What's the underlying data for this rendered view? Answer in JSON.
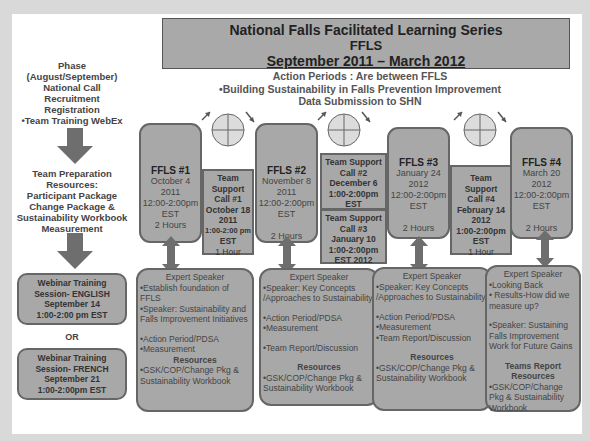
{
  "header": {
    "line1": "National  Falls Facilitated Learning Series",
    "line2": "FFLS",
    "line3": "September 2011 – March 2012"
  },
  "subtitle": {
    "line1": "Action Periods : Are between FFLS",
    "line2": "•Building Sustainability in Falls Prevention Improvement",
    "line3": "Data Submission to SHN"
  },
  "left_panel": {
    "phase": [
      "Phase  (August/September)",
      "National Call",
      "Recruitment",
      "Registration",
      "•Team Training  WebEx"
    ],
    "preparation": [
      "Team Preparation",
      "Resources:",
      "Participant Package",
      "Change Package &",
      "Sustainability Workbook",
      "Measurement"
    ],
    "webinar_english": [
      "Webinar Training",
      "Session- ENGLISH",
      "September 14",
      "1:00-2:00 pm EST"
    ],
    "or_label": "OR",
    "webinar_french": [
      "Webinar Training",
      "Session- FRENCH",
      "September 21",
      "1:00-2:00pm EST"
    ]
  },
  "pdsa_cycle": {
    "icon": "pdsa-cycle-icon",
    "quadrants": [
      "Act",
      "Plan",
      "Study",
      "Do"
    ]
  },
  "sessions": [
    {
      "title": "FFLS #1",
      "date": "October 4",
      "year": "2011",
      "time": "12:00-2:00pm",
      "tz": "EST",
      "duration": "2 Hours"
    },
    {
      "title": "FFLS #2",
      "date": "November 8",
      "year": "2011",
      "time": "12:00-2:00pm",
      "tz": "EST",
      "duration": "2 Hours"
    },
    {
      "title": "FFLS #3",
      "date": "January 24",
      "year": "2012",
      "time": "12:00-2:00pm",
      "tz": "EST",
      "duration": "2 Hours"
    },
    {
      "title": "FFLS #4",
      "date": "March 20",
      "year": "2012",
      "time": "12:00-2:00pm",
      "tz": "EST",
      "duration": "2 Hours"
    }
  ],
  "support_calls": [
    {
      "lines": [
        "Team",
        "Support",
        "Call #1",
        "October 18",
        "2011",
        "1:00-2:00 pm",
        "EST"
      ],
      "duration": "1 Hour"
    },
    {
      "lines": [
        "Team Support",
        "Call #2",
        "December 6",
        "1:00-2:00pm",
        "EST"
      ],
      "duration": ""
    },
    {
      "lines": [
        "Team Support",
        "Call #3",
        "January 10",
        "1:00-2:00pm",
        "EST 2012"
      ],
      "duration": ""
    },
    {
      "lines": [
        "Team",
        "Support",
        "Call #4",
        "February 14",
        "2012",
        "1:00-2:00pm",
        "EST"
      ],
      "duration": "1 Hour"
    }
  ],
  "expert_boxes": [
    {
      "heading": "Expert Speaker",
      "items1": [
        "•Establish foundation of FFLS",
        "•Speaker: Sustainability and Falls Improvement Initiatives"
      ],
      "items2": [
        "•Action Period/PDSA",
        "•Measurement"
      ],
      "resources_label": "Resources",
      "resources": "•GSK/COP/Change Pkg & Sustainability Workbook"
    },
    {
      "heading": "Expert Speaker",
      "items1": [
        "•Speaker: Key Concepts /Approaches to Sustainability"
      ],
      "items2": [
        "•Action Period/PDSA",
        "•Measurement"
      ],
      "items3": [
        "•Team Report/Discussion"
      ],
      "resources_label": "Resources",
      "resources": "•GSK/COP/Change Pkg & Sustainability  Workbook"
    },
    {
      "heading": "Expert Speaker",
      "items1": [
        "•Speaker: Key Concepts /Approaches to Sustainability"
      ],
      "items2": [
        "•Action Period/PDSA",
        "•Measurement",
        "•Team Report/Discussion"
      ],
      "resources_label": "Resources",
      "resources": "•GSK/COP/Change Pkg & Sustainability  Workbook"
    },
    {
      "heading": "Expert Speaker",
      "items1": [
        "•Looking  Back",
        "• Results-How did we measure up?"
      ],
      "items2": [
        "•Speaker: Sustaining Falls Improvement Work for Future Gains"
      ],
      "reports_label": "Teams Report",
      "resources_label": "Resources",
      "resources": "•GSK/COP/Change Pkg & Sustainability Workbook"
    }
  ],
  "colors": {
    "box_fill": "#a8a8a8",
    "box_border": "#666666",
    "arrow": "#6e6e6e",
    "background": "#ffffff"
  }
}
